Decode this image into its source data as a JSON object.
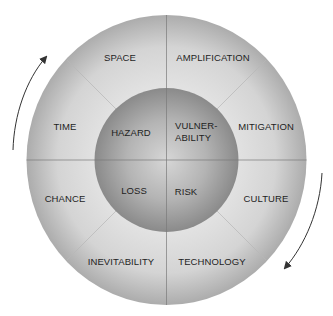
{
  "diagram": {
    "outer_ring": {
      "segments": [
        {
          "label": "SPACE",
          "x": 120,
          "y": 58
        },
        {
          "label": "AMPLIFICATION",
          "x": 213,
          "y": 58
        },
        {
          "label": "MITIGATION",
          "x": 266,
          "y": 127
        },
        {
          "label": "CULTURE",
          "x": 266,
          "y": 199
        },
        {
          "label": "TECHNOLOGY",
          "x": 212,
          "y": 262
        },
        {
          "label": "INEVITABILITY",
          "x": 121,
          "y": 262
        },
        {
          "label": "CHANCE",
          "x": 65,
          "y": 199
        },
        {
          "label": "TIME",
          "x": 65,
          "y": 127
        }
      ]
    },
    "inner_circle": {
      "quadrants": [
        {
          "label": "HAZARD",
          "x": 131,
          "y": 133
        },
        {
          "label": "VULNER-\nABILITY",
          "x": 175,
          "y": 132
        },
        {
          "label": "LOSS",
          "x": 134,
          "y": 191
        },
        {
          "label": "RISK",
          "x": 186,
          "y": 192
        }
      ]
    },
    "arrows": [
      {
        "name": "clockwise-arrow-left",
        "direction": "up"
      },
      {
        "name": "clockwise-arrow-right",
        "direction": "down"
      }
    ],
    "colors": {
      "outer_ring_light": "#e4e4e4",
      "outer_ring_dark": "#a9a9a9",
      "inner_light": "#cfcfcf",
      "inner_dark": "#8d8d8d",
      "divider": "#7a7a7a",
      "text": "#1e1e1e",
      "arrow": "#333333"
    }
  }
}
